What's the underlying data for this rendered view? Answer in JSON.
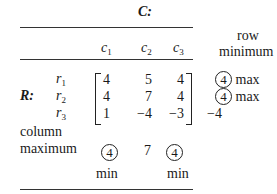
{
  "table": {
    "column_player": "C:",
    "row_player": "R:",
    "columns": [
      {
        "name": "c",
        "sub": "1"
      },
      {
        "name": "c",
        "sub": "2"
      },
      {
        "name": "c",
        "sub": "3"
      }
    ],
    "rows": [
      {
        "name": "r",
        "sub": "1",
        "values": [
          "4",
          "5",
          "4"
        ],
        "row_min": "4",
        "row_min_circled": true,
        "row_note": "max"
      },
      {
        "name": "r",
        "sub": "2",
        "values": [
          "4",
          "7",
          "4"
        ],
        "row_min": "4",
        "row_min_circled": true,
        "row_note": "max"
      },
      {
        "name": "r",
        "sub": "3",
        "values": [
          "1",
          "−4",
          "−3"
        ],
        "row_min": "−4",
        "row_min_circled": false,
        "row_note": ""
      }
    ],
    "row_min_header_line1": "row",
    "row_min_header_line2": "minimum",
    "col_max_label_line1": "column",
    "col_max_label_line2": "maximum",
    "column_maxima": [
      {
        "value": "4",
        "circled": true,
        "note": "min"
      },
      {
        "value": "7",
        "circled": false,
        "note": ""
      },
      {
        "value": "4",
        "circled": true,
        "note": "min"
      }
    ]
  }
}
